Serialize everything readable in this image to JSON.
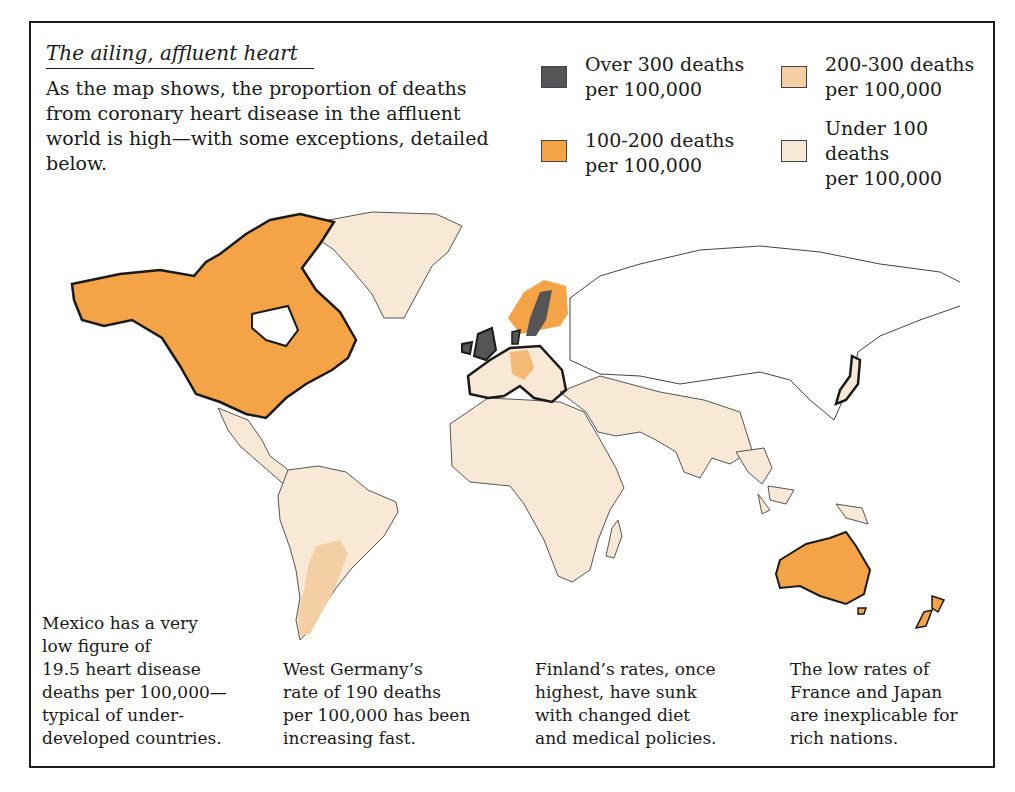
{
  "title": "The ailing, affluent heart",
  "intro": "As the map shows, the proportion of deaths from coronary heart disease in the affluent world is high—with some exceptions, detailed below.",
  "colors": {
    "over_300": "#555558",
    "range_200_300": "#f3cfa3",
    "range_100_200": "#f4a447",
    "under_100": "#f7e9d6",
    "no_data": "#ffffff",
    "outline": "#1a1a1a"
  },
  "legend": [
    {
      "label_1": "Over 300 deaths",
      "label_2": "per 100,000",
      "color": "#555558"
    },
    {
      "label_1": "200-300 deaths",
      "label_2": "per 100,000",
      "color": "#f3cfa3"
    },
    {
      "label_1": "100-200 deaths",
      "label_2": "per 100,000",
      "color": "#f4a447"
    },
    {
      "label_1": "Under 100",
      "label_2": "deaths",
      "label_3": "per 100,000",
      "color": "#f7e9d6"
    }
  ],
  "notes": [
    {
      "lines": [
        "Mexico has a very",
        "low figure of",
        "19.5 heart disease",
        "deaths per 100,000—",
        "typical of under-",
        "developed countries."
      ]
    },
    {
      "lines": [
        "West Germany’s",
        "rate of 190 deaths",
        "per 100,000 has been",
        "increasing fast."
      ]
    },
    {
      "lines": [
        "Finland’s rates, once",
        "highest, have sunk",
        "with changed diet",
        "and medical policies."
      ]
    },
    {
      "lines": [
        "The low rates of",
        "France and Japan",
        "are inexplicable for",
        "rich nations."
      ]
    }
  ],
  "map": {
    "regions": [
      {
        "name": "Canada and USA",
        "category": "100-200"
      },
      {
        "name": "Australia",
        "category": "100-200"
      },
      {
        "name": "New Zealand",
        "category": "100-200"
      },
      {
        "name": "Finland / Norway",
        "category": "100-200"
      },
      {
        "name": "West Germany",
        "category": "100-200"
      },
      {
        "name": "Sweden",
        "category": "Over 300"
      },
      {
        "name": "United Kingdom / Ireland",
        "category": "Over 300"
      },
      {
        "name": "Denmark",
        "category": "Over 300"
      },
      {
        "name": "Argentina",
        "category": "200-300"
      },
      {
        "name": "Mexico, Central & South America",
        "category": "Under 100"
      },
      {
        "name": "Greenland",
        "category": "Under 100"
      },
      {
        "name": "Africa",
        "category": "Under 100"
      },
      {
        "name": "Western Europe (France etc.)",
        "category": "Under 100"
      },
      {
        "name": "Middle East / South Asia",
        "category": "Under 100"
      },
      {
        "name": "Southeast Asia",
        "category": "Under 100"
      },
      {
        "name": "Japan",
        "category": "Under 100"
      },
      {
        "name": "USSR / North Asia",
        "category": "No data"
      }
    ]
  }
}
